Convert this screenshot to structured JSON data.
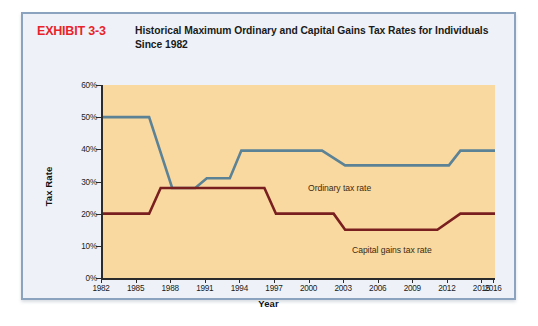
{
  "exhibit": {
    "label": "EXHIBIT 3-3",
    "title": "Historical Maximum Ordinary and Capital Gains Tax Rates for Individuals Since 1982"
  },
  "colors": {
    "exhibit_label": "#e8242a",
    "panel_background": "#eef2f8",
    "panel_border": "#8ca3bf",
    "plot_background": "#fad9a0",
    "axis": "#2b2b2b",
    "ordinary_line": "#5c8296",
    "capital_gains_line": "#7a1f1f"
  },
  "chart_data": {
    "type": "line",
    "title": "Historical Maximum Ordinary and Capital Gains Tax Rates for Individuals Since 1982",
    "xlabel": "Year",
    "ylabel": "Tax Rate",
    "xlim": [
      1982,
      2016
    ],
    "ylim": [
      0,
      60
    ],
    "grid": false,
    "legend_position": "inline-annotations",
    "x_tick_labels": [
      "1982",
      "1985",
      "1988",
      "1991",
      "1994",
      "1997",
      "2000",
      "2003",
      "2006",
      "2009",
      "2012",
      "2015",
      "2016"
    ],
    "x_tick_values": [
      1982,
      1985,
      1988,
      1991,
      1994,
      1997,
      2000,
      2003,
      2006,
      2009,
      2012,
      2015,
      2016
    ],
    "y_tick_labels": [
      "0%",
      "10%",
      "20%",
      "30%",
      "40%",
      "50%",
      "60%"
    ],
    "y_tick_values": [
      0,
      10,
      20,
      30,
      40,
      50,
      60
    ],
    "series": [
      {
        "name": "Ordinary tax rate",
        "color": "#5c8296",
        "annotation": "Ordinary tax rate",
        "x": [
          1982,
          1986,
          1988,
          1990,
          1991,
          1993,
          1994,
          2001,
          2003,
          2012,
          2013,
          2016
        ],
        "values": [
          50,
          50,
          28,
          28,
          31,
          31,
          39.6,
          39.6,
          35,
          35,
          39.6,
          39.6
        ]
      },
      {
        "name": "Capital gains tax rate",
        "color": "#7a1f1f",
        "annotation": "Capital gains tax rate",
        "x": [
          1982,
          1986,
          1987,
          1996,
          1997,
          2002,
          2003,
          2011,
          2013,
          2016
        ],
        "values": [
          20,
          20,
          28,
          28,
          20,
          20,
          15,
          15,
          20,
          20
        ]
      }
    ]
  }
}
